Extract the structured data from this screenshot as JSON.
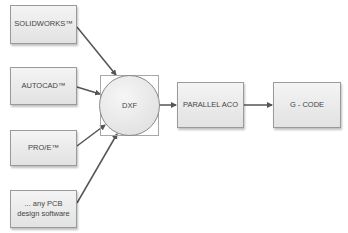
{
  "diagram": {
    "sources": [
      {
        "id": "solidworks",
        "label": "SOLIDWORKS™"
      },
      {
        "id": "autocad",
        "label": "AUTOCAD™"
      },
      {
        "id": "proe",
        "label": "PRO/E™"
      },
      {
        "id": "pcb",
        "label": "... any PCB design software"
      }
    ],
    "hub": {
      "id": "dxf",
      "label": "DXF"
    },
    "pipeline": [
      {
        "id": "parallel-aco",
        "label": "PARALLEL ACO"
      },
      {
        "id": "g-code",
        "label": "G - CODE"
      }
    ],
    "edges": [
      [
        "solidworks",
        "dxf"
      ],
      [
        "autocad",
        "dxf"
      ],
      [
        "proe",
        "dxf"
      ],
      [
        "pcb",
        "dxf"
      ],
      [
        "dxf",
        "parallel-aco"
      ],
      [
        "parallel-aco",
        "g-code"
      ]
    ],
    "colors": {
      "line": "#555555",
      "box_border": "#9a9a9a",
      "text": "#444444"
    }
  }
}
